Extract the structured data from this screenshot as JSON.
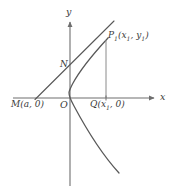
{
  "figure": {
    "type": "analytic-geometry-diagram",
    "background_color": "#ffffff",
    "stroke_color": "#555555",
    "axis_color": "#6e6e6e",
    "label_color": "#3a3a3a",
    "axes": {
      "x_label": "x",
      "y_label": "y",
      "origin_label": "O",
      "x_axis_y_px": 98,
      "y_axis_x_px": 70
    },
    "labels": {
      "point_m": "M(a, 0)",
      "point_n": "N",
      "point_q_prefix": "Q(x",
      "point_q_sub": "1",
      "point_q_suffix": ", 0)",
      "point_p_prefix": "P",
      "point_p_sub_main": "1",
      "point_p_open": "(x",
      "point_p_sub_x": "1",
      "point_p_mid": ", y",
      "point_p_sub_y": "1",
      "point_p_close": ")"
    },
    "points": {
      "M": {
        "x": 36,
        "y": 98,
        "label": "M(a, 0)"
      },
      "O": {
        "x": 70,
        "y": 98,
        "label": "O"
      },
      "N": {
        "x": 72,
        "y": 68,
        "label": "N"
      },
      "Q": {
        "x": 106,
        "y": 98,
        "label": "Q(x1, 0)"
      },
      "P1": {
        "x": 106,
        "y": 40,
        "label": "P1(x1, y1)"
      }
    },
    "curve": {
      "kind": "parabola",
      "opens": "right",
      "vertex_px": {
        "x": 69,
        "y": 92
      },
      "upper_end_px": {
        "x": 108,
        "y": 38
      },
      "lower_end_px": {
        "x": 119,
        "y": 173
      }
    },
    "secant": {
      "from_px": {
        "x": 35,
        "y": 99
      },
      "through_px": {
        "x": 106,
        "y": 40
      },
      "to_px": {
        "x": 114,
        "y": 21
      }
    },
    "dropline": {
      "from_px": {
        "x": 106,
        "y": 40
      },
      "to_px": {
        "x": 106,
        "y": 98
      }
    }
  }
}
